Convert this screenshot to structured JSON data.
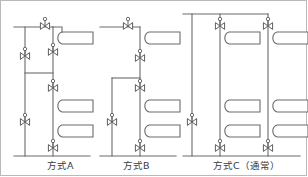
{
  "figure": {
    "type": "piping-schematic",
    "title_visible": false,
    "border_color": "#b9b9b9",
    "line_color": "#6b6b6b",
    "fill_color": "#ffffff",
    "text_color": "#3a3a3a"
  },
  "captions": {
    "a": "方式A",
    "b": "方式B",
    "c": "方式C（通常）"
  },
  "schemes": [
    {
      "id": "a",
      "label": "方式A",
      "risers": 1,
      "radiators": 3,
      "valves": 6,
      "bypass_riser": true,
      "description_visible": false
    },
    {
      "id": "b",
      "label": "方式B",
      "risers": 1,
      "radiators": 3,
      "valves": 6,
      "bypass_riser": true,
      "description_visible": false
    },
    {
      "id": "c",
      "label": "方式C（通常）",
      "risers": 2,
      "radiators": 6,
      "valves": 9,
      "bypass_riser": true,
      "description_visible": false
    }
  ],
  "symbols": {
    "valve": "gate-valve-icon",
    "radiator": "radiator-icon",
    "pipe": "pipe-line"
  }
}
